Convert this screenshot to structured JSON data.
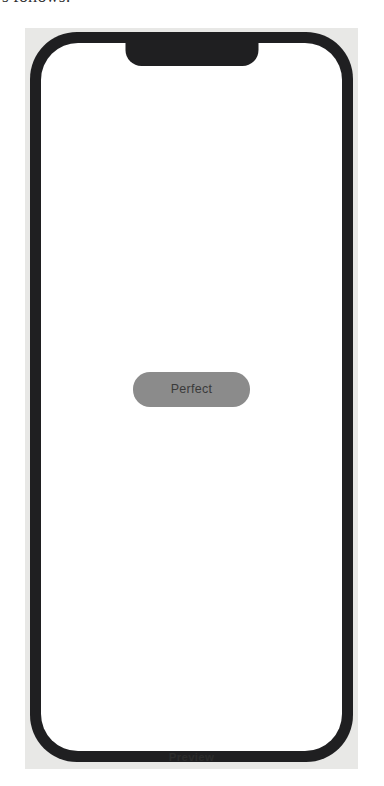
{
  "page": {
    "clipped_text_line": "s follows:"
  },
  "preview_panel": {
    "caption": "Preview",
    "background_color": "#e8e8e6"
  },
  "device": {
    "frame_color": "#1f1f21",
    "screen_background_color": "#ffffff",
    "notch": "notch"
  },
  "screen": {
    "button": {
      "label": "Perfect",
      "background_color": "#8b8b8b",
      "text_color": "#3a3a3a"
    }
  }
}
